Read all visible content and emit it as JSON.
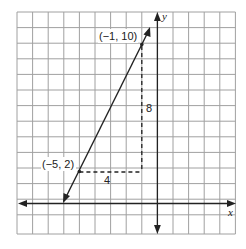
{
  "diagram": {
    "type": "coordinate-grid-slope",
    "axes": {
      "x_label": "x",
      "y_label": "y"
    },
    "points": [
      {
        "label": "(−1, 10)",
        "x": -1,
        "y": 10
      },
      {
        "label": "(−5, 2)",
        "x": -5,
        "y": 2
      }
    ],
    "rise_label": "8",
    "run_label": "4",
    "colors": {
      "grid": "#9a9a9a",
      "ink": "#222222"
    }
  }
}
